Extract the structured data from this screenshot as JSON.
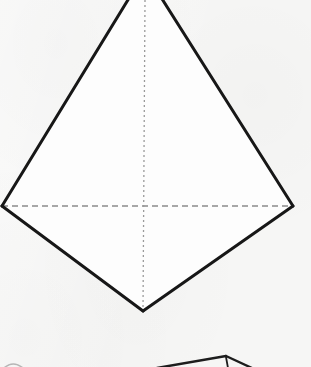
{
  "canvas": {
    "width": 311,
    "height": 367,
    "background_color": "#f6f6f5",
    "description": "Scanned geometry textbook figure: a tetrahedron drawn in wireframe, apex cropped by the top edge of the image; a second figure is cropped by the bottom edge."
  },
  "style": {
    "solid_edge_color": "#171717",
    "solid_edge_width": 3,
    "hidden_edge_color": "#8a8a8a",
    "hidden_edge_width": 1.6,
    "axis_line_color": "#9a9a9a",
    "axis_line_width": 1.3,
    "face_fill_color": "#fdfdfd",
    "partial_figure_color": "#1d1d1d",
    "partial_figure_width": 2.4,
    "horizontal_dash_pattern": "6 4",
    "vertical_dash_pattern": "2 3"
  },
  "main_figure": {
    "name": "tetrahedron",
    "vertices": {
      "apex": {
        "label": "apex",
        "x": 145,
        "y": -28,
        "cropped": "true"
      },
      "left": {
        "label": "left-base-vertex",
        "x": 2,
        "y": 206
      },
      "right": {
        "label": "right-base-vertex",
        "x": 293,
        "y": 206
      },
      "bottom": {
        "label": "bottom-base-vertex",
        "x": 143,
        "y": 311
      }
    },
    "solid_edges": [
      {
        "name": "apex-to-left-edge",
        "points": "145,-28 2,206"
      },
      {
        "name": "apex-to-right-edge",
        "points": "145,-28 293,206"
      },
      {
        "name": "left-to-bottom-edge",
        "points": "2,206 143,311"
      },
      {
        "name": "right-to-bottom-edge",
        "points": "293,206 143,311"
      }
    ],
    "hidden_edges": [
      {
        "name": "base-diagonal-hidden-edge",
        "points": "2,206 293,206"
      }
    ],
    "axis_lines": [
      {
        "name": "vertical-symmetry-axis",
        "points": "145,0 143,311"
      }
    ],
    "faces": [
      {
        "name": "upper-front-face",
        "points": "145,-28 2,206 293,206"
      },
      {
        "name": "lower-front-face",
        "points": "2,206 293,206 143,311"
      }
    ]
  },
  "partial_figure": {
    "name": "cropped-lower-figure",
    "cropped": "true",
    "edges": [
      {
        "name": "lower-figure-left-ridge",
        "points": "157,368 226,356"
      },
      {
        "name": "lower-figure-right-ridge",
        "points": "226,356 252,368"
      },
      {
        "name": "lower-figure-inner-edge",
        "points": "226,357 228,368"
      }
    ],
    "arc": {
      "name": "lower-left-cropped-arc",
      "path": "M 4,368 Q 13,360 23,368",
      "color": "#b6b6b6",
      "width": 1.6
    }
  }
}
